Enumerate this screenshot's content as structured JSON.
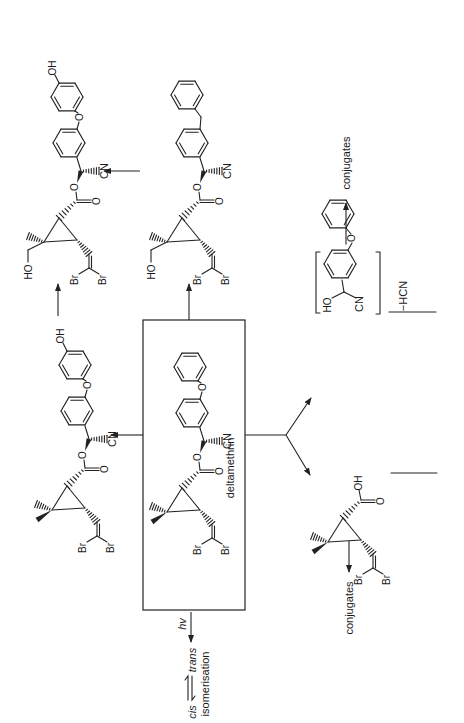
{
  "diagram": {
    "parent_compound": {
      "name": "deltamethrin",
      "atoms": {
        "oxygen": "O",
        "cyano": "CN",
        "bromine": "Br"
      }
    },
    "metabolites": [
      {
        "id": "4-hydroxy",
        "labels": {
          "hydroxyl": "OH",
          "ether_oxygen": "O",
          "ester_oxygen": "O",
          "carbonyl_oxygen": "O",
          "cyano": "CN",
          "bromine": "Br"
        }
      },
      {
        "id": "4-hydroxy-hydroxymethyl",
        "labels": {
          "hydroxyl": "OH",
          "ether_oxygen": "O",
          "ester_oxygen": "O",
          "carbonyl_oxygen": "O",
          "cyano": "CN",
          "hydroxymethyl": "HO",
          "bromine": "Br"
        }
      },
      {
        "id": "hydroxymethyl-benzyl",
        "labels": {
          "ester_oxygen": "O",
          "carbonyl_oxygen": "O",
          "cyano": "CN",
          "hydroxymethyl": "HO",
          "bromine": "Br"
        }
      },
      {
        "id": "cyanohydrin",
        "labels": {
          "hydroxyl": "HO",
          "ether_oxygen": "O",
          "cyano": "CN"
        }
      },
      {
        "id": "dibromovinyl-acid",
        "labels": {
          "acid_hydroxyl": "OH",
          "carbonyl_oxygen": "O",
          "bromine": "Br"
        }
      }
    ],
    "reaction_labels": {
      "photo": "hv",
      "isomer_cis": "cis",
      "isomer_trans": "trans",
      "isomerisation": "isomerisation",
      "loss": "−HCN",
      "conjugates_1": "conjugates",
      "conjugates_2": "conjugates"
    }
  }
}
